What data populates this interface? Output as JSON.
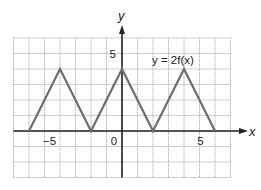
{
  "chart_data": {
    "type": "line",
    "title": "",
    "function_label": "y = 2f(x)",
    "xlabel": "x",
    "ylabel": "y",
    "xlim": [
      -7,
      7
    ],
    "ylim": [
      -3,
      6
    ],
    "grid": true,
    "x_tick_labels": [
      {
        "value": -5,
        "label": "−5"
      },
      {
        "value": 0,
        "label": "0"
      },
      {
        "value": 5,
        "label": "5"
      }
    ],
    "y_tick_labels": [
      {
        "value": 5,
        "label": "5"
      }
    ],
    "series": [
      {
        "name": "y = 2f(x)",
        "x": [
          -6,
          -4,
          -2,
          0,
          2,
          4,
          6
        ],
        "y": [
          0,
          4,
          0,
          4,
          0,
          4,
          0
        ]
      }
    ],
    "colors": {
      "grid": "#9a9a9a",
      "axis": "#222222",
      "curve": "#6e6e6e"
    }
  }
}
